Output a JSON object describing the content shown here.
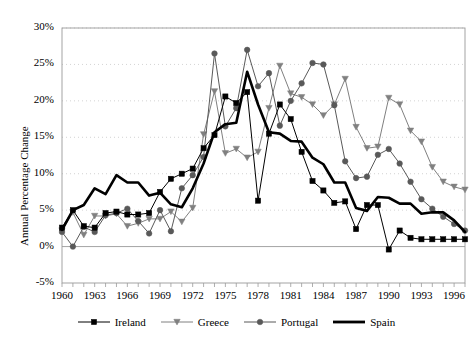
{
  "chart_data": {
    "type": "line",
    "title": "",
    "xlabel": "",
    "ylabel": "Annual Percentage Change",
    "xlim": [
      1960,
      1997
    ],
    "ylim": [
      -5,
      30
    ],
    "ytick_labels": [
      "30%",
      "25%",
      "20%",
      "15%",
      "10%",
      "5%",
      "0%",
      "-5%"
    ],
    "ytick_values": [
      30,
      25,
      20,
      15,
      10,
      5,
      0,
      -5
    ],
    "xtick_labels": [
      "1960",
      "1963",
      "1966",
      "1969",
      "1972",
      "1975",
      "1978",
      "1981",
      "1984",
      "1987",
      "1990",
      "1993",
      "1996"
    ],
    "xtick_values": [
      1960,
      1963,
      1966,
      1969,
      1972,
      1975,
      1978,
      1981,
      1984,
      1987,
      1990,
      1993,
      1996
    ],
    "grid": true,
    "legend_position": "bottom",
    "x": [
      1960,
      1961,
      1962,
      1963,
      1964,
      1965,
      1966,
      1967,
      1968,
      1969,
      1970,
      1971,
      1972,
      1973,
      1974,
      1975,
      1976,
      1977,
      1978,
      1979,
      1980,
      1981,
      1982,
      1983,
      1984,
      1985,
      1986,
      1987,
      1988,
      1989,
      1990,
      1991,
      1992,
      1993,
      1994,
      1995,
      1996,
      1997
    ],
    "series": [
      {
        "name": "Ireland",
        "color": "#000000",
        "marker": "square",
        "marker_color": "#000000",
        "line_width": 1,
        "values": [
          2.6,
          5.0,
          2.8,
          2.6,
          4.6,
          4.8,
          4.4,
          4.4,
          4.6,
          7.5,
          9.3,
          10.0,
          10.7,
          13.5,
          15.3,
          20.6,
          19.7,
          21.2,
          6.3,
          15.5,
          19.5,
          17.5,
          13.0,
          9.0,
          7.7,
          6.0,
          6.2,
          2.4,
          5.7,
          5.7,
          -0.4,
          2.2,
          1.2,
          1.0,
          1.0,
          1.0,
          1.0,
          1.0
        ]
      },
      {
        "name": "Greece",
        "color": "#808080",
        "marker": "triangle-down",
        "marker_color": "#808080",
        "line_width": 1,
        "values": [
          2.2,
          4.7,
          1.6,
          4.2,
          4.2,
          4.5,
          2.8,
          3.2,
          3.8,
          3.8,
          4.8,
          3.4,
          5.3,
          15.4,
          21.3,
          12.8,
          13.4,
          12.2,
          13.0,
          19.0,
          24.8,
          21.0,
          20.5,
          19.5,
          18.0,
          19.5,
          23.0,
          16.4,
          13.5,
          13.7,
          20.4,
          19.5,
          15.9,
          14.4,
          10.9,
          8.9,
          8.2,
          7.8
        ]
      },
      {
        "name": "Portugal",
        "color": "#595959",
        "marker": "circle",
        "marker_color": "#595959",
        "line_width": 1,
        "values": [
          2.0,
          0.0,
          2.7,
          2.0,
          4.3,
          4.6,
          5.2,
          3.5,
          1.8,
          5.0,
          2.1,
          8.0,
          9.8,
          12.3,
          26.5,
          16.5,
          19.0,
          27.0,
          22.0,
          23.8,
          16.6,
          20.0,
          22.4,
          25.2,
          25.0,
          19.4,
          11.7,
          9.4,
          9.6,
          12.6,
          13.4,
          11.4,
          8.9,
          6.5,
          5.2,
          4.1,
          3.1,
          2.2
        ]
      },
      {
        "name": "Spain",
        "color": "#000000",
        "marker": "none",
        "marker_color": "#000000",
        "line_width": 2.6,
        "values": [
          2.3,
          5.0,
          5.7,
          8.0,
          7.2,
          9.8,
          8.8,
          8.8,
          7.0,
          7.4,
          5.8,
          5.4,
          8.0,
          11.4,
          15.7,
          16.8,
          17.0,
          24.0,
          19.5,
          15.7,
          15.5,
          14.5,
          14.4,
          12.2,
          11.3,
          8.8,
          8.8,
          5.3,
          4.9,
          6.8,
          6.7,
          5.9,
          5.9,
          4.5,
          4.7,
          4.7,
          3.6,
          2.0
        ]
      }
    ]
  },
  "legend": {
    "items": [
      {
        "label": "Ireland",
        "marker": "square-marker"
      },
      {
        "label": "Greece",
        "marker": "triangle-marker"
      },
      {
        "label": "Portugal",
        "marker": "circle-marker"
      },
      {
        "label": "Spain",
        "marker": "line-marker"
      }
    ]
  },
  "axis": {
    "y_title": "Annual Percentage Change"
  }
}
